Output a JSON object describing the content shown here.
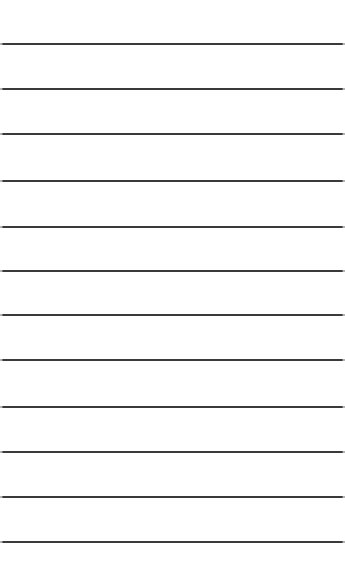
{
  "page": {
    "background": "#ffffff",
    "line_color": "#3a3a3a",
    "line_thickness_px": 2,
    "line_count": 12,
    "line_positions_y": [
      43,
      88,
      133,
      180,
      226,
      270,
      314,
      359,
      406,
      451,
      496,
      541
    ]
  }
}
